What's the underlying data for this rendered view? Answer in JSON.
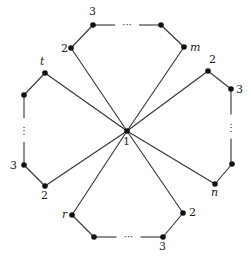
{
  "diagram": {
    "type": "graph",
    "center": {
      "id": "1",
      "label": "1",
      "x": 127,
      "y": 131
    },
    "nodes": [
      {
        "id": "t2",
        "label": "2",
        "x": 71,
        "y": 48,
        "lx": 61,
        "ly": 52,
        "italic": false
      },
      {
        "id": "t3",
        "label": "3",
        "x": 93,
        "y": 25,
        "lx": 89,
        "ly": 15,
        "italic": false
      },
      {
        "id": "tk",
        "label": "",
        "x": 161,
        "y": 25,
        "lx": 0,
        "ly": 0,
        "italic": false
      },
      {
        "id": "tm",
        "label": "m",
        "x": 184,
        "y": 47,
        "lx": 190,
        "ly": 51,
        "italic": true
      },
      {
        "id": "r2",
        "label": "2",
        "x": 208,
        "y": 71,
        "lx": 209,
        "ly": 63,
        "italic": false
      },
      {
        "id": "r3",
        "label": "3",
        "x": 231,
        "y": 89,
        "lx": 236,
        "ly": 93,
        "italic": false
      },
      {
        "id": "rk",
        "label": "",
        "x": 232,
        "y": 164,
        "lx": 0,
        "ly": 0,
        "italic": false
      },
      {
        "id": "rn",
        "label": "n",
        "x": 215,
        "y": 184,
        "lx": 211,
        "ly": 196,
        "italic": true
      },
      {
        "id": "b2",
        "label": "2",
        "x": 183,
        "y": 213,
        "lx": 189,
        "ly": 216,
        "italic": false
      },
      {
        "id": "b3",
        "label": "3",
        "x": 163,
        "y": 237,
        "lx": 159,
        "ly": 250,
        "italic": false
      },
      {
        "id": "bk",
        "label": "",
        "x": 94,
        "y": 237,
        "lx": 0,
        "ly": 0,
        "italic": false
      },
      {
        "id": "br",
        "label": "r",
        "x": 72,
        "y": 215,
        "lx": 62,
        "ly": 218,
        "italic": true
      },
      {
        "id": "lt",
        "label": "t",
        "x": 45,
        "y": 73,
        "lx": 40,
        "ly": 65,
        "italic": true
      },
      {
        "id": "lk",
        "label": "",
        "x": 24,
        "y": 95,
        "lx": 0,
        "ly": 0,
        "italic": false
      },
      {
        "id": "l3",
        "label": "3",
        "x": 24,
        "y": 165,
        "lx": 10,
        "ly": 169,
        "italic": false
      },
      {
        "id": "l2",
        "label": "2",
        "x": 45,
        "y": 186,
        "lx": 41,
        "ly": 199,
        "italic": false
      }
    ],
    "edges": [
      [
        "center",
        "t2"
      ],
      [
        "t2",
        "t3"
      ],
      [
        "tk",
        "tm"
      ],
      [
        "tm",
        "center"
      ],
      [
        "center",
        "r2"
      ],
      [
        "r2",
        "r3"
      ],
      [
        "rk",
        "rn"
      ],
      [
        "rn",
        "center"
      ],
      [
        "center",
        "b2"
      ],
      [
        "b2",
        "b3"
      ],
      [
        "bk",
        "br"
      ],
      [
        "br",
        "center"
      ],
      [
        "center",
        "lt"
      ],
      [
        "lt",
        "lk"
      ],
      [
        "l3",
        "l2"
      ],
      [
        "l2",
        "center"
      ]
    ],
    "ellipsis_segments": [
      {
        "from": "t3",
        "to": "tk",
        "orient": "h",
        "text": "···"
      },
      {
        "from": "r3",
        "to": "rk",
        "orient": "v",
        "text": "⋮"
      },
      {
        "from": "b3",
        "to": "bk",
        "orient": "h",
        "text": "···"
      },
      {
        "from": "lk",
        "to": "l3",
        "orient": "v",
        "text": "⋮"
      }
    ],
    "colors": {
      "line": "#333333",
      "node": "#111111",
      "text": "#222222"
    }
  }
}
